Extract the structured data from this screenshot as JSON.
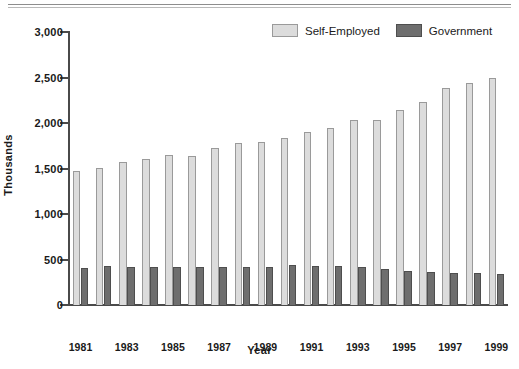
{
  "chart_data": {
    "type": "bar",
    "title": "",
    "xlabel": "Year",
    "ylabel": "Thousands",
    "ylim": [
      0,
      3000
    ],
    "ytick_values": [
      0,
      500,
      1000,
      1500,
      2000,
      2500,
      3000
    ],
    "ytick_labels": [
      "0",
      "500",
      "1,000",
      "1,500",
      "2,000",
      "2,500",
      "3,000"
    ],
    "grid": false,
    "legend_position": "top-right",
    "categories": [
      "1981",
      "1982",
      "1983",
      "1984",
      "1985",
      "1986",
      "1987",
      "1988",
      "1989",
      "1990",
      "1991",
      "1992",
      "1993",
      "1994",
      "1995",
      "1996",
      "1997",
      "1998",
      "1999"
    ],
    "xtick_labels_shown": [
      "1981",
      "",
      "1983",
      "",
      "1985",
      "",
      "1987",
      "",
      "1989",
      "",
      "1991",
      "",
      "1993",
      "",
      "1995",
      "",
      "1997",
      "",
      "1999"
    ],
    "series": [
      {
        "name": "Self-Employed",
        "color": "#dcdcdc",
        "values": [
          1470,
          1510,
          1570,
          1610,
          1650,
          1640,
          1730,
          1780,
          1790,
          1840,
          1900,
          1940,
          2030,
          2030,
          2140,
          2230,
          2380,
          2440,
          2490
        ]
      },
      {
        "name": "Government",
        "color": "#6e6e6e",
        "values": [
          410,
          430,
          420,
          420,
          420,
          420,
          420,
          420,
          420,
          440,
          430,
          430,
          420,
          400,
          370,
          360,
          350,
          350,
          340
        ]
      }
    ]
  },
  "legend": {
    "items": [
      {
        "label": "Self-Employed",
        "swatch": "light-gray-swatch"
      },
      {
        "label": "Government",
        "swatch": "dark-gray-swatch"
      }
    ]
  },
  "axes": {
    "y_title": "Thousands",
    "x_title": "Year"
  }
}
